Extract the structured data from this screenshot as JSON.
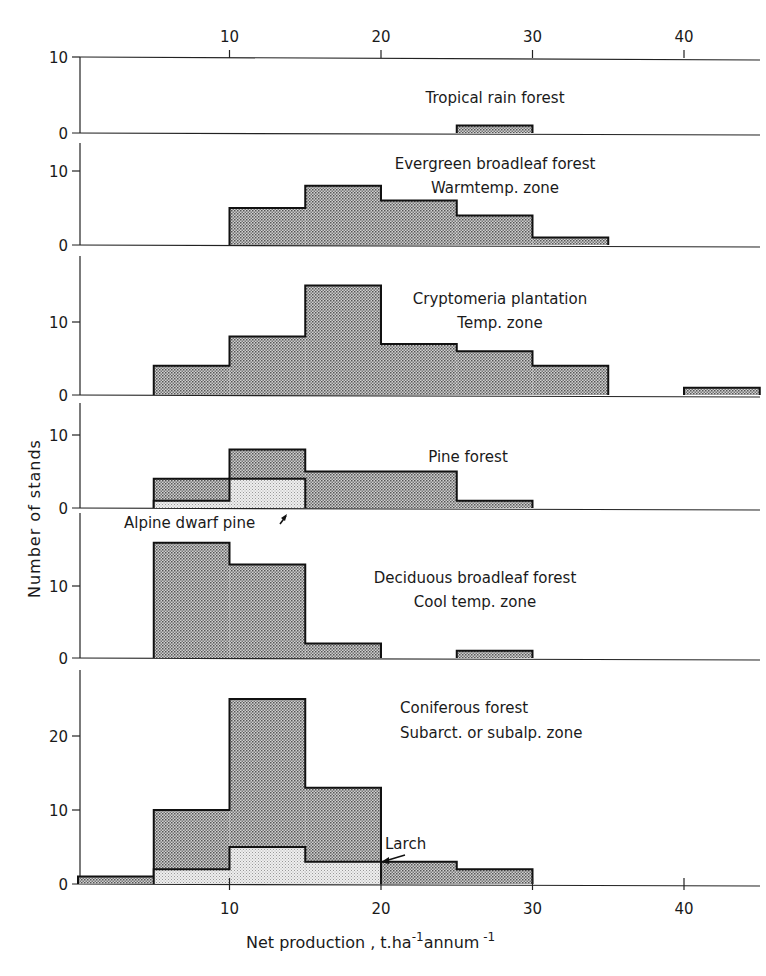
{
  "chart_data": {
    "type": "bar",
    "subtype": "stacked-histogram-panels",
    "xlabel": "Net production , t.ha-1 annum-1",
    "xlabel_parts": {
      "base": "Net production , t.ha",
      "sup1": "-1",
      "mid": "annum",
      "sup2": "-1"
    },
    "ylabel": "Number of stands",
    "x_ticks": [
      10,
      20,
      30,
      40
    ],
    "xlim": [
      0,
      45
    ],
    "bin_width": 5,
    "colors": {
      "main_fill": "#bdbdbd",
      "sub_fill": "#e6e6e6",
      "stroke": "#111111"
    },
    "panels": [
      {
        "id": "tropical",
        "labels": [
          "Tropical rain forest"
        ],
        "y_ticks": [
          0,
          10
        ],
        "ylim": [
          0,
          10
        ],
        "series": [
          {
            "name": "Tropical rain forest",
            "bins": [
              [
                25,
                30,
                1
              ]
            ]
          }
        ]
      },
      {
        "id": "evergreen",
        "labels": [
          "Evergreen broadleaf forest",
          "Warmtemp. zone"
        ],
        "y_ticks": [
          0,
          10
        ],
        "ylim": [
          0,
          13
        ],
        "series": [
          {
            "name": "Evergreen broadleaf forest",
            "bins": [
              [
                10,
                15,
                5
              ],
              [
                15,
                20,
                8
              ],
              [
                20,
                25,
                6
              ],
              [
                25,
                30,
                4
              ],
              [
                30,
                35,
                1
              ]
            ]
          }
        ]
      },
      {
        "id": "cryptomeria",
        "labels": [
          "Cryptomeria plantation",
          "Temp. zone"
        ],
        "y_ticks": [
          0,
          10
        ],
        "ylim": [
          0,
          17
        ],
        "series": [
          {
            "name": "Cryptomeria plantation",
            "bins": [
              [
                5,
                10,
                4
              ],
              [
                10,
                15,
                8
              ],
              [
                15,
                20,
                15
              ],
              [
                20,
                25,
                7
              ],
              [
                25,
                30,
                6
              ],
              [
                30,
                35,
                4
              ],
              [
                40,
                45,
                1
              ]
            ]
          }
        ]
      },
      {
        "id": "pine",
        "labels": [
          "Pine forest"
        ],
        "y_ticks": [
          0,
          10
        ],
        "ylim": [
          0,
          12
        ],
        "series": [
          {
            "name": "Pine forest",
            "bins": [
              [
                5,
                10,
                4
              ],
              [
                10,
                15,
                8
              ],
              [
                15,
                20,
                5
              ],
              [
                20,
                25,
                5
              ],
              [
                25,
                30,
                1
              ]
            ]
          },
          {
            "name": "Alpine dwarf pine",
            "bins": [
              [
                5,
                10,
                1
              ],
              [
                10,
                15,
                4
              ]
            ]
          }
        ],
        "annotation": {
          "text": "Alpine dwarf pine",
          "points_to": [
            14,
            0
          ]
        }
      },
      {
        "id": "deciduous",
        "labels": [
          "Deciduous broadleaf forest",
          "Cool temp. zone"
        ],
        "y_ticks": [
          0,
          10
        ],
        "ylim": [
          0,
          19
        ],
        "series": [
          {
            "name": "Deciduous broadleaf forest",
            "bins": [
              [
                5,
                10,
                16
              ],
              [
                10,
                15,
                13
              ],
              [
                15,
                20,
                2
              ],
              [
                25,
                30,
                1
              ]
            ]
          }
        ]
      },
      {
        "id": "coniferous",
        "labels": [
          "Coniferous forest",
          "Subarct. or subalp. zone"
        ],
        "y_ticks": [
          0,
          10,
          20
        ],
        "ylim": [
          0,
          29
        ],
        "series": [
          {
            "name": "Coniferous forest",
            "bins": [
              [
                0,
                5,
                1
              ],
              [
                5,
                10,
                10
              ],
              [
                10,
                15,
                25
              ],
              [
                15,
                20,
                13
              ],
              [
                20,
                25,
                3
              ],
              [
                25,
                30,
                2
              ]
            ]
          },
          {
            "name": "Larch",
            "bins": [
              [
                5,
                10,
                2
              ],
              [
                10,
                15,
                5
              ],
              [
                15,
                20,
                3
              ]
            ]
          }
        ],
        "annotation": {
          "text": "Larch",
          "points_to": [
            20,
            3
          ]
        }
      }
    ]
  }
}
